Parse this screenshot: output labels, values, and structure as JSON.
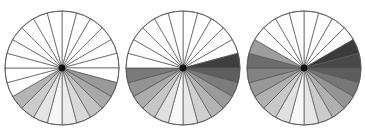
{
  "figure": {
    "type": "radial-sector-diagram-series",
    "panel_count": 3,
    "canvas_width": 365,
    "canvas_height": 136,
    "background_color": "#ffffff",
    "sectors_per_circle": 24,
    "sector_angle_degrees": 15,
    "outline_color": "#555555",
    "unshaded_color": "#ffffff",
    "hub_color": "#111111",
    "hub_radius": 3.4
  },
  "chart_data": {
    "type": "pie",
    "title": "",
    "subtitle": "",
    "xlabel": "",
    "ylabel": "",
    "legend": [],
    "grid": false,
    "shared": {
      "slice_count": 24,
      "slice_value": 1,
      "slice_angle_deg": 15,
      "start_angle_deg": -90,
      "direction": "clockwise"
    },
    "panels": [
      {
        "name": "panel-1",
        "center_x": 62,
        "center_y": 68,
        "radius": 57,
        "shaded_slice_count": 9,
        "shaded_fraction": 0.375,
        "shaded_span_degrees": 135,
        "slice_fills": [
          "#ffffff",
          "#ffffff",
          "#ffffff",
          "#ffffff",
          "#ffffff",
          "#ffffff",
          "#ffffff",
          "#9a9a9a",
          "#a8a8a8",
          "#c2c2c2",
          "#d8d8d8",
          "#ececec",
          "#f7f7f7",
          "#e4e4e4",
          "#cccccc",
          "#b4b4b4",
          "#ffffff",
          "#ffffff",
          "#ffffff",
          "#ffffff",
          "#ffffff",
          "#ffffff",
          "#ffffff",
          "#ffffff"
        ]
      },
      {
        "name": "panel-2",
        "center_x": 183,
        "center_y": 68,
        "radius": 57,
        "shaded_slice_count": 13,
        "shaded_fraction": 0.542,
        "shaded_span_degrees": 195,
        "slice_fills": [
          "#ffffff",
          "#ffffff",
          "#ffffff",
          "#ffffff",
          "#ffffff",
          "#3f3f3f",
          "#5e5e5e",
          "#7c7c7c",
          "#9a9a9a",
          "#b4b4b4",
          "#cfcfcf",
          "#e8e8e8",
          "#f8f8f8",
          "#e0e0e0",
          "#c6c6c6",
          "#adadad",
          "#939393",
          "#7a7a7a",
          "#ffffff",
          "#ffffff",
          "#ffffff",
          "#ffffff",
          "#ffffff",
          "#ffffff"
        ]
      },
      {
        "name": "panel-3",
        "center_x": 304,
        "center_y": 68,
        "radius": 57,
        "shaded_slice_count": 16,
        "shaded_fraction": 0.667,
        "shaded_span_degrees": 240,
        "slice_fills": [
          "#ffffff",
          "#ffffff",
          "#ffffff",
          "#ffffff",
          "#3a3a3a",
          "#494949",
          "#5d5d5d",
          "#777777",
          "#949494",
          "#b0b0b0",
          "#cbcbcb",
          "#e6e6e6",
          "#f8f8f8",
          "#e0e0e0",
          "#c8c8c8",
          "#b0b0b0",
          "#989898",
          "#828282",
          "#6d6d6d",
          "#9e9e9e",
          "#ffffff",
          "#ffffff",
          "#ffffff",
          "#ffffff"
        ]
      }
    ]
  }
}
